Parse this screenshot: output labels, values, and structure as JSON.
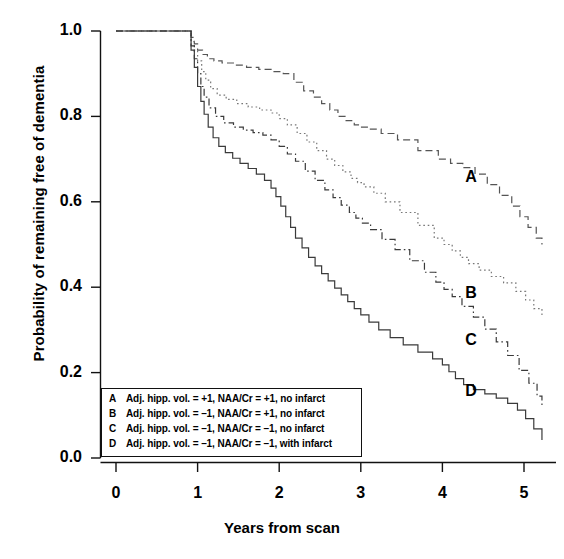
{
  "chart_data": {
    "type": "line",
    "title": "",
    "subtitle": "",
    "xlabel": "Years from scan",
    "ylabel": "Probability of remaining free of dementia",
    "xlim": [
      -0.2,
      5.35
    ],
    "ylim": [
      0.0,
      1.0
    ],
    "xticks": [
      0,
      1,
      2,
      3,
      4,
      5
    ],
    "xticklabels": [
      "0",
      "1",
      "2",
      "3",
      "4",
      "5"
    ],
    "yticks": [
      0.0,
      0.2,
      0.4,
      0.6,
      0.8,
      1.0
    ],
    "yticklabels": [
      "0.0",
      "0.2",
      "0.4",
      "0.6",
      "0.8",
      "1.0"
    ],
    "grid": false,
    "legend_position": "lower-left-inside",
    "step_style": "post",
    "annotations": [
      {
        "text": "A",
        "x": 4.35,
        "y": 0.655
      },
      {
        "text": "B",
        "x": 4.35,
        "y": 0.385
      },
      {
        "text": "C",
        "x": 4.35,
        "y": 0.275
      },
      {
        "text": "D",
        "x": 4.35,
        "y": 0.155
      }
    ],
    "series": [
      {
        "name": "A",
        "label": "Adj. hipp. vol. = +1, NAA/Cr = +1, no infarct",
        "dash": "dashed",
        "color": "#555555",
        "x": [
          0.0,
          0.88,
          0.92,
          0.96,
          1.0,
          1.06,
          1.12,
          1.2,
          1.3,
          1.45,
          1.6,
          1.75,
          1.9,
          2.05,
          2.18,
          2.3,
          2.42,
          2.52,
          2.62,
          2.72,
          2.82,
          2.92,
          3.0,
          3.1,
          3.25,
          3.45,
          3.7,
          3.95,
          4.1,
          4.25,
          4.4,
          4.55,
          4.7,
          4.85,
          4.95,
          5.05,
          5.15,
          5.22
        ],
        "y": [
          1.0,
          1.0,
          0.985,
          0.97,
          0.955,
          0.945,
          0.935,
          0.93,
          0.925,
          0.92,
          0.915,
          0.91,
          0.905,
          0.9,
          0.88,
          0.86,
          0.845,
          0.83,
          0.815,
          0.8,
          0.79,
          0.78,
          0.775,
          0.77,
          0.76,
          0.745,
          0.72,
          0.7,
          0.69,
          0.68,
          0.665,
          0.64,
          0.615,
          0.59,
          0.565,
          0.54,
          0.515,
          0.5
        ]
      },
      {
        "name": "B",
        "label": "Adj. hipp. vol. = -1, NAA/Cr = +1, no infarct",
        "dash": "dotted",
        "color": "#777777",
        "x": [
          0.0,
          0.88,
          0.92,
          0.96,
          1.0,
          1.05,
          1.1,
          1.16,
          1.24,
          1.35,
          1.48,
          1.62,
          1.76,
          1.9,
          2.0,
          2.1,
          2.22,
          2.34,
          2.46,
          2.58,
          2.68,
          2.78,
          2.88,
          2.96,
          3.04,
          3.16,
          3.3,
          3.48,
          3.7,
          3.9,
          4.02,
          4.12,
          4.22,
          4.32,
          4.45,
          4.6,
          4.75,
          4.9,
          5.02,
          5.12,
          5.22
        ],
        "y": [
          1.0,
          1.0,
          0.975,
          0.955,
          0.93,
          0.905,
          0.885,
          0.865,
          0.85,
          0.84,
          0.83,
          0.822,
          0.815,
          0.808,
          0.795,
          0.78,
          0.76,
          0.74,
          0.72,
          0.7,
          0.685,
          0.67,
          0.655,
          0.645,
          0.635,
          0.62,
          0.6,
          0.575,
          0.545,
          0.515,
          0.5,
          0.485,
          0.47,
          0.455,
          0.44,
          0.425,
          0.41,
          0.39,
          0.37,
          0.35,
          0.33
        ]
      },
      {
        "name": "C",
        "label": "Adj. hipp. vol. = -1, NAA/Cr = -1, no infarct",
        "dash": "dashdot",
        "color": "#3a3a3a",
        "x": [
          0.0,
          0.88,
          0.92,
          0.96,
          1.0,
          1.04,
          1.08,
          1.14,
          1.22,
          1.32,
          1.44,
          1.56,
          1.68,
          1.8,
          1.9,
          2.0,
          2.1,
          2.2,
          2.32,
          2.44,
          2.56,
          2.66,
          2.76,
          2.86,
          2.94,
          3.02,
          3.12,
          3.26,
          3.42,
          3.6,
          3.78,
          3.92,
          4.02,
          4.12,
          4.24,
          4.38,
          4.52,
          4.66,
          4.8,
          4.94,
          5.06,
          5.16,
          5.22
        ],
        "y": [
          1.0,
          1.0,
          0.965,
          0.935,
          0.9,
          0.87,
          0.845,
          0.82,
          0.8,
          0.785,
          0.775,
          0.768,
          0.762,
          0.756,
          0.745,
          0.73,
          0.712,
          0.695,
          0.672,
          0.65,
          0.628,
          0.61,
          0.592,
          0.575,
          0.562,
          0.55,
          0.535,
          0.512,
          0.488,
          0.462,
          0.435,
          0.412,
          0.395,
          0.378,
          0.355,
          0.33,
          0.302,
          0.272,
          0.24,
          0.205,
          0.175,
          0.145,
          0.12
        ]
      },
      {
        "name": "D",
        "label": "Adj. hipp. vol. = -1, NAA/Cr = -1, with infarct",
        "dash": "solid",
        "color": "#3a3a3a",
        "x": [
          0.0,
          0.88,
          0.92,
          0.96,
          1.0,
          1.04,
          1.08,
          1.13,
          1.19,
          1.26,
          1.34,
          1.43,
          1.52,
          1.62,
          1.72,
          1.82,
          1.9,
          1.96,
          2.02,
          2.08,
          2.14,
          2.2,
          2.28,
          2.36,
          2.44,
          2.52,
          2.6,
          2.68,
          2.76,
          2.84,
          2.92,
          3.0,
          3.1,
          3.22,
          3.36,
          3.52,
          3.7,
          3.88,
          4.0,
          4.08,
          4.16,
          4.26,
          4.38,
          4.52,
          4.66,
          4.8,
          4.92,
          5.02,
          5.12,
          5.22
        ],
        "y": [
          1.0,
          1.0,
          0.955,
          0.915,
          0.87,
          0.835,
          0.805,
          0.775,
          0.75,
          0.73,
          0.715,
          0.702,
          0.69,
          0.678,
          0.665,
          0.65,
          0.632,
          0.612,
          0.59,
          0.565,
          0.54,
          0.515,
          0.492,
          0.47,
          0.45,
          0.432,
          0.415,
          0.398,
          0.382,
          0.366,
          0.35,
          0.335,
          0.318,
          0.3,
          0.282,
          0.265,
          0.248,
          0.232,
          0.218,
          0.202,
          0.186,
          0.172,
          0.16,
          0.15,
          0.14,
          0.128,
          0.112,
          0.092,
          0.068,
          0.042
        ]
      }
    ]
  },
  "legend": {
    "entries": [
      {
        "key": "A",
        "text": "Adj. hipp. vol. = +1, NAA/Cr = +1, no infarct"
      },
      {
        "key": "B",
        "text": "Adj. hipp. vol. = –1, NAA/Cr = +1, no infarct"
      },
      {
        "key": "C",
        "text": "Adj. hipp. vol. = –1, NAA/Cr = –1, no infarct"
      },
      {
        "key": "D",
        "text": "Adj. hipp. vol. = –1, NAA/Cr = –1, with infarct"
      }
    ]
  },
  "axes": {
    "x_title": "Years from scan",
    "y_title": "Probability of remaining free of dementia"
  }
}
